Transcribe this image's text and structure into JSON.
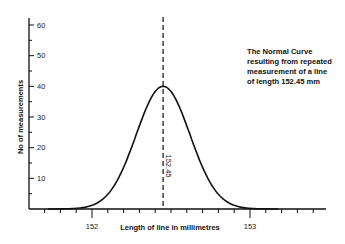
{
  "chart_data": {
    "type": "line",
    "title": "",
    "xlabel": "Length of line in millimetres",
    "ylabel": "No of measurements",
    "xlim": [
      151.6,
      153.5
    ],
    "ylim": [
      0,
      62
    ],
    "x_ticks_major": [
      152,
      153
    ],
    "x_tick_labels": [
      "152",
      "153"
    ],
    "x_minor_step": 0.1,
    "y_ticks_major": [
      10,
      20,
      30,
      40,
      50,
      60
    ],
    "y_tick_labels": [
      "10",
      "20",
      "30",
      "40",
      "50",
      "60"
    ],
    "y_minor_step": 5,
    "grid": false,
    "series": [
      {
        "name": "Normal curve",
        "distribution": "normal",
        "mean": 152.45,
        "sigma": 0.17,
        "peak": 40,
        "x": [
          151.8,
          151.9,
          152.0,
          152.1,
          152.2,
          152.3,
          152.4,
          152.45,
          152.5,
          152.6,
          152.7,
          152.8,
          152.9,
          153.0,
          153.1
        ],
        "values": [
          0.3,
          1.1,
          3.0,
          7.1,
          13.5,
          23.0,
          35.3,
          40,
          38.3,
          27.2,
          15.3,
          7.1,
          2.4,
          0.7,
          0.1
        ]
      }
    ],
    "annotations": [
      {
        "type": "vertical-dashed-line",
        "x": 152.45,
        "label": "152.45"
      },
      {
        "type": "text",
        "lines": [
          "The Normal Curve",
          "resulting from repeated",
          "measurement of a line",
          "of length 152.45 mm"
        ]
      }
    ]
  },
  "labels": {
    "xlabel": "Length of line in millimetres",
    "ylabel": "No of measurements",
    "mean_label": "152.45",
    "y_ticks": [
      "10",
      "20",
      "30",
      "40",
      "50",
      "60"
    ],
    "x_ticks": [
      "152",
      "153"
    ],
    "annotation": "The Normal Curve\nresulting from repeated\nmeasurement of a line\nof length 152.45 mm"
  },
  "colors": {
    "ink": "#111111",
    "background": "#ffffff"
  }
}
